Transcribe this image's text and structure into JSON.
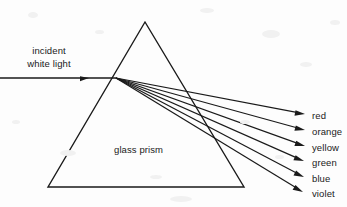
{
  "figure": {
    "background_color": "#fdfdfd",
    "stroke_color": "#1a1a1a",
    "text_color": "#1a1a1a"
  },
  "incident": {
    "label_line1": "incident",
    "label_line2": "white light",
    "ray": {
      "x1": 0,
      "y1": 78,
      "x2": 116,
      "y2": 78
    },
    "arrowhead": {
      "x": 89,
      "y": 78
    }
  },
  "prism": {
    "label": "glass prism",
    "apex": {
      "x": 145,
      "y": 22
    },
    "base_left": {
      "x": 48,
      "y": 187
    },
    "base_right": {
      "x": 244,
      "y": 187
    },
    "dispersion_point": {
      "x": 116,
      "y": 78
    }
  },
  "spectrum": {
    "rays": [
      {
        "name": "red",
        "label": "red",
        "tip_x": 305,
        "tip_y": 114,
        "label_y": 109
      },
      {
        "name": "orange",
        "label": "orange",
        "tip_x": 305,
        "tip_y": 130,
        "label_y": 125
      },
      {
        "name": "yellow",
        "label": "yellow",
        "tip_x": 305,
        "tip_y": 146,
        "label_y": 141
      },
      {
        "name": "green",
        "label": "green",
        "tip_x": 304,
        "tip_y": 161,
        "label_y": 156
      },
      {
        "name": "blue",
        "label": "blue",
        "tip_x": 304,
        "tip_y": 177,
        "label_y": 172
      },
      {
        "name": "violet",
        "label": "violet",
        "tip_x": 303,
        "tip_y": 192,
        "label_y": 187
      }
    ]
  }
}
